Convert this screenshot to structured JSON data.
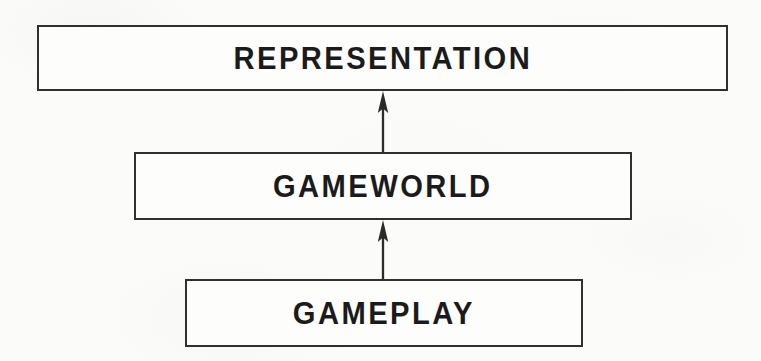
{
  "diagram": {
    "type": "layered-stack-flow",
    "background_color": "#fbfbfa",
    "stroke_color": "#30302f",
    "text_color": "#1b1b1b",
    "nodes": [
      {
        "id": "representation",
        "label": "REPRESENTATION",
        "icon": "rectangle-box-icon",
        "layer": 3,
        "position": "top"
      },
      {
        "id": "gameworld",
        "label": "GAMEWORLD",
        "icon": "rectangle-box-icon",
        "layer": 2,
        "position": "middle"
      },
      {
        "id": "gameplay",
        "label": "GAMEPLAY",
        "icon": "rectangle-box-icon",
        "layer": 1,
        "position": "bottom"
      }
    ],
    "edges": [
      {
        "id": "gameworld-to-representation",
        "from": "gameworld",
        "to": "representation",
        "icon": "arrow-up-icon",
        "direction": "up",
        "label": ""
      },
      {
        "id": "gameplay-to-gameworld",
        "from": "gameplay",
        "to": "gameworld",
        "icon": "arrow-up-icon",
        "direction": "up",
        "label": ""
      }
    ]
  }
}
